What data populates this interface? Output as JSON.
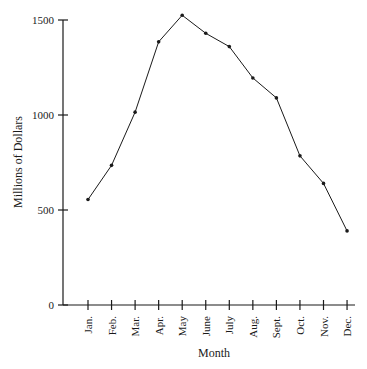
{
  "chart_data": {
    "type": "line",
    "title": "",
    "xlabel": "Month",
    "ylabel": "Millions of Dollars",
    "categories": [
      "Jan.",
      "Feb.",
      "Mar.",
      "Apr.",
      "May",
      "June",
      "July",
      "Aug.",
      "Sept.",
      "Oct.",
      "Nov.",
      "Dec."
    ],
    "series": [
      {
        "name": "Sales",
        "values": [
          555,
          735,
          1015,
          1385,
          1525,
          1430,
          1360,
          1195,
          1090,
          785,
          640,
          390
        ]
      }
    ],
    "ylim": [
      0,
      1500
    ],
    "yticks": [
      0,
      500,
      1000,
      1500
    ],
    "ytick_labels": [
      "0",
      "500",
      "1000",
      "1500"
    ],
    "grid": false,
    "legend": "none",
    "line_color": "#1a1a1a"
  }
}
